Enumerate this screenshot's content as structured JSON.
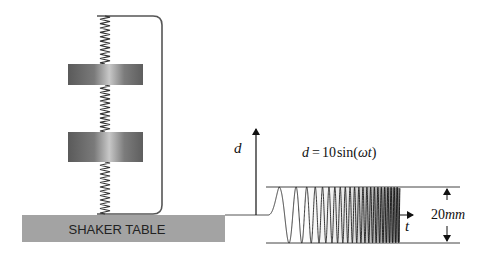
{
  "diagram": {
    "shaker_table": {
      "label": "SHAKER TABLE",
      "color": "#a3a3a3"
    },
    "masses": [
      {
        "id": "upper-mass"
      },
      {
        "id": "lower-mass"
      }
    ],
    "springs": [
      {
        "id": "top-spring"
      },
      {
        "id": "middle-spring"
      },
      {
        "id": "bottom-spring"
      }
    ],
    "plot": {
      "y_axis_label": "d",
      "x_axis_label": "t",
      "equation_lhs": "d",
      "equation_eq": "=",
      "equation_coeff": "10",
      "equation_func": "sin(",
      "equation_arg": "ωt",
      "equation_close": ")",
      "amplitude_label_number": "20",
      "amplitude_label_unit": "mm",
      "waveform": "swept sine (chirp), increasing frequency"
    }
  }
}
